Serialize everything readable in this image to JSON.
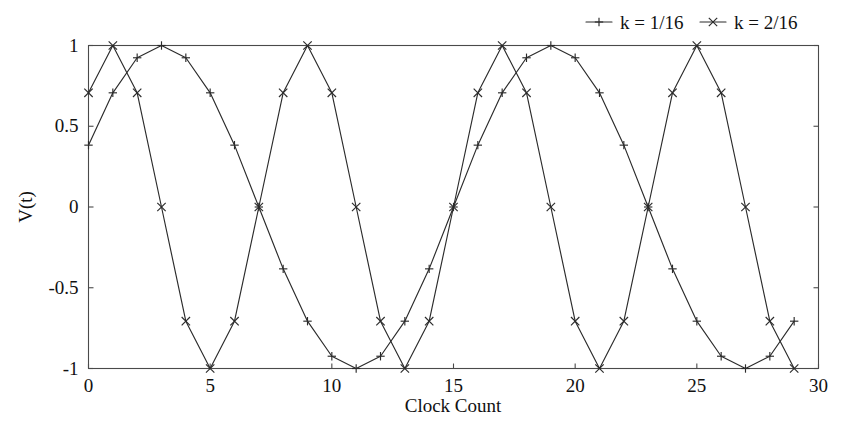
{
  "chart_data": {
    "type": "line",
    "title": "",
    "xlabel": "Clock Count",
    "ylabel": "V(t)",
    "xlim": [
      0,
      30
    ],
    "ylim": [
      -1,
      1
    ],
    "xticks": [
      0,
      5,
      10,
      15,
      20,
      25,
      30
    ],
    "xtick_labels": [
      "0",
      "5",
      "10",
      "15",
      "20",
      "25",
      "30"
    ],
    "yticks": [
      -1,
      -0.5,
      0,
      0.5,
      1
    ],
    "ytick_labels": [
      "-1",
      "-0.5",
      "0",
      "0.5",
      "1"
    ],
    "grid": false,
    "legend_position": "top-right",
    "line_color": "#2b2b2b",
    "axis_color": "#4a4a4a",
    "x": [
      0,
      1,
      2,
      3,
      4,
      5,
      6,
      7,
      8,
      9,
      10,
      11,
      12,
      13,
      14,
      15,
      16,
      17,
      18,
      19,
      20,
      21,
      22,
      23,
      24,
      25,
      26,
      27,
      28,
      29
    ],
    "series": [
      {
        "name": "k = 1/16",
        "marker": "plus",
        "values": [
          0.383,
          0.707,
          0.924,
          1.0,
          0.924,
          0.707,
          0.383,
          0.0,
          -0.383,
          -0.707,
          -0.924,
          -1.0,
          -0.924,
          -0.707,
          -0.383,
          0.0,
          0.383,
          0.707,
          0.924,
          1.0,
          0.924,
          0.707,
          0.383,
          0.0,
          -0.383,
          -0.707,
          -0.924,
          -1.0,
          -0.924,
          -0.707
        ]
      },
      {
        "name": "k = 2/16",
        "marker": "cross",
        "values": [
          0.707,
          1.0,
          0.707,
          0.0,
          -0.707,
          -1.0,
          -0.707,
          0.0,
          0.707,
          1.0,
          0.707,
          0.0,
          -0.707,
          -1.0,
          -0.707,
          0.0,
          0.707,
          1.0,
          0.707,
          0.0,
          -0.707,
          -1.0,
          -0.707,
          0.0,
          0.707,
          1.0,
          0.707,
          0.0,
          -0.707,
          -1.0
        ]
      }
    ]
  },
  "legend": {
    "entries": [
      {
        "label": "k = 1/16",
        "marker": "plus-marker"
      },
      {
        "label": "k = 2/16",
        "marker": "cross-marker"
      }
    ]
  },
  "axes": {
    "x_axis_title": "Clock Count",
    "y_axis_title": "V(t)"
  }
}
